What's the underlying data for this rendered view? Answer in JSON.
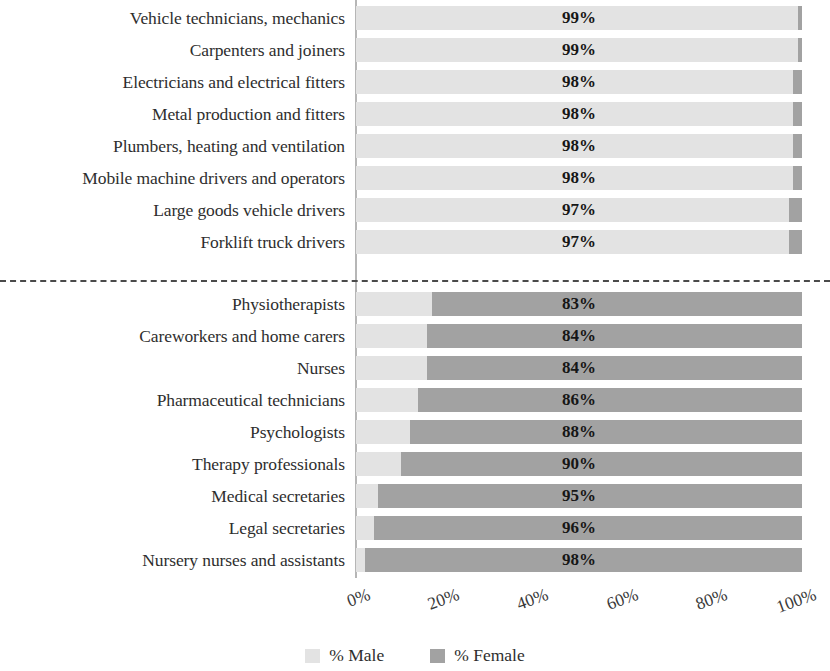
{
  "chart_data": {
    "type": "bar",
    "subtype": "stacked-horizontal-100",
    "title": "",
    "xlabel": "",
    "ylabel": "",
    "xlim": [
      0,
      100
    ],
    "grid": false,
    "legend_position": "bottom-center",
    "series": [
      {
        "name": "% Male",
        "color": "#e3e3e3",
        "values": [
          99,
          99,
          98,
          98,
          98,
          98,
          97,
          97,
          17,
          16,
          16,
          14,
          12,
          10,
          5,
          4,
          2
        ]
      },
      {
        "name": "% Female",
        "color": "#a2a2a2",
        "values": [
          1,
          1,
          2,
          2,
          2,
          2,
          3,
          3,
          83,
          84,
          84,
          86,
          88,
          90,
          95,
          96,
          98
        ]
      }
    ],
    "categories": [
      "Vehicle technicians, mechanics",
      "Carpenters and joiners",
      "Electricians and electrical fitters",
      "Metal production and fitters",
      "Plumbers, heating and ventilation",
      "Mobile machine drivers and operators",
      "Large goods vehicle drivers",
      "Forklift truck drivers",
      "Physiotherapists",
      "Careworkers and home carers",
      "Nurses",
      "Pharmaceutical technicians",
      "Psychologists",
      "Therapy professionals",
      "Medical secretaries",
      "Legal secretaries",
      "Nursery nurses and assistants"
    ],
    "data_labels": [
      "99%",
      "99%",
      "98%",
      "98%",
      "98%",
      "98%",
      "97%",
      "97%",
      "83%",
      "84%",
      "84%",
      "86%",
      "88%",
      "90%",
      "95%",
      "96%",
      "98%"
    ],
    "xticks": [
      0,
      20,
      40,
      60,
      80,
      100
    ],
    "xtick_labels": [
      "0%",
      "20%",
      "40%",
      "60%",
      "80%",
      "100%"
    ]
  },
  "rows": [
    {
      "label": "Vehicle technicians, mechanics",
      "male": 99,
      "female": 1,
      "value_label": "99%",
      "group": "male-dominated"
    },
    {
      "label": "Carpenters and joiners",
      "male": 99,
      "female": 1,
      "value_label": "99%",
      "group": "male-dominated"
    },
    {
      "label": "Electricians and electrical fitters",
      "male": 98,
      "female": 2,
      "value_label": "98%",
      "group": "male-dominated"
    },
    {
      "label": "Metal production and fitters",
      "male": 98,
      "female": 2,
      "value_label": "98%",
      "group": "male-dominated"
    },
    {
      "label": "Plumbers, heating and ventilation",
      "male": 98,
      "female": 2,
      "value_label": "98%",
      "group": "male-dominated"
    },
    {
      "label": "Mobile machine drivers and operators",
      "male": 98,
      "female": 2,
      "value_label": "98%",
      "group": "male-dominated"
    },
    {
      "label": "Large goods vehicle drivers",
      "male": 97,
      "female": 3,
      "value_label": "97%",
      "group": "male-dominated"
    },
    {
      "label": "Forklift truck drivers",
      "male": 97,
      "female": 3,
      "value_label": "97%",
      "group": "male-dominated"
    },
    {
      "label": "Physiotherapists",
      "male": 17,
      "female": 83,
      "value_label": "83%",
      "group": "female-dominated"
    },
    {
      "label": "Careworkers and home carers",
      "male": 16,
      "female": 84,
      "value_label": "84%",
      "group": "female-dominated"
    },
    {
      "label": "Nurses",
      "male": 16,
      "female": 84,
      "value_label": "84%",
      "group": "female-dominated"
    },
    {
      "label": "Pharmaceutical technicians",
      "male": 14,
      "female": 86,
      "value_label": "86%",
      "group": "female-dominated"
    },
    {
      "label": "Psychologists",
      "male": 12,
      "female": 88,
      "value_label": "88%",
      "group": "female-dominated"
    },
    {
      "label": "Therapy professionals",
      "male": 10,
      "female": 90,
      "value_label": "90%",
      "group": "female-dominated"
    },
    {
      "label": "Medical secretaries",
      "male": 5,
      "female": 95,
      "value_label": "95%",
      "group": "female-dominated"
    },
    {
      "label": "Legal secretaries",
      "male": 4,
      "female": 96,
      "value_label": "96%",
      "group": "female-dominated"
    },
    {
      "label": "Nursery nurses and assistants",
      "male": 2,
      "female": 98,
      "value_label": "98%",
      "group": "female-dominated"
    }
  ],
  "xaxis": {
    "ticks": [
      "0%",
      "20%",
      "40%",
      "60%",
      "80%",
      "100%"
    ]
  },
  "legend": {
    "items": [
      {
        "label": "% Male",
        "color": "#e3e3e3"
      },
      {
        "label": "% Female",
        "color": "#a2a2a2"
      }
    ]
  },
  "colors": {
    "male": "#e3e3e3",
    "female": "#a2a2a2",
    "axis": "#b6b6b6",
    "divider": "#4a4a4a",
    "text": "#2e2e2e"
  }
}
